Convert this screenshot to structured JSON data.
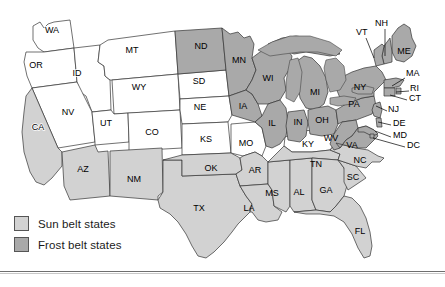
{
  "figure": {
    "colors": {
      "sun_belt": "#d2d2d2",
      "frost_belt": "#a9a9a9",
      "unshaded": "#ffffff",
      "outline": "#333333",
      "label_text": "#000000"
    }
  },
  "legend": {
    "items": [
      {
        "swatch": "sun-belt-swatch",
        "label": "Sun belt states",
        "color": "#d2d2d2"
      },
      {
        "swatch": "frost-belt-swatch",
        "label": "Frost belt states",
        "color": "#a9a9a9"
      }
    ]
  },
  "map": {
    "classification": {
      "sun_belt": [
        "CA",
        "AZ",
        "NM",
        "TX",
        "OK",
        "AR",
        "LA",
        "MS",
        "AL",
        "GA",
        "FL",
        "SC",
        "NC",
        "TN"
      ],
      "frost_belt": [
        "ND",
        "MN",
        "WI",
        "MI",
        "IA",
        "IL",
        "IN",
        "OH",
        "PA",
        "NY",
        "WV",
        "VA",
        "MD",
        "DE",
        "NJ",
        "CT",
        "RI",
        "MA",
        "VT",
        "NH",
        "ME",
        "DC"
      ],
      "unshaded": [
        "WA",
        "OR",
        "ID",
        "MT",
        "WY",
        "NV",
        "UT",
        "CO",
        "SD",
        "NE",
        "KS",
        "MO",
        "KY"
      ]
    },
    "labels_on_state": [
      {
        "abbr": "WA",
        "x": 52,
        "y": 31,
        "shade": "none"
      },
      {
        "abbr": "OR",
        "x": 36,
        "y": 66,
        "shade": "none"
      },
      {
        "abbr": "ID",
        "x": 77,
        "y": 74,
        "shade": "none"
      },
      {
        "abbr": "MT",
        "x": 132,
        "y": 51,
        "shade": "none"
      },
      {
        "abbr": "ND",
        "x": 201,
        "y": 47,
        "shade": "frost"
      },
      {
        "abbr": "MN",
        "x": 239,
        "y": 61,
        "shade": "frost"
      },
      {
        "abbr": "SD",
        "x": 199,
        "y": 82,
        "shade": "none"
      },
      {
        "abbr": "WY",
        "x": 139,
        "y": 88,
        "shade": "none"
      },
      {
        "abbr": "WI",
        "x": 268,
        "y": 79,
        "shade": "frost"
      },
      {
        "abbr": "MI",
        "x": 315,
        "y": 93,
        "shade": "frost"
      },
      {
        "abbr": "NE",
        "x": 200,
        "y": 108,
        "shade": "none"
      },
      {
        "abbr": "IA",
        "x": 243,
        "y": 107,
        "shade": "frost"
      },
      {
        "abbr": "NV",
        "x": 68,
        "y": 113,
        "shade": "none"
      },
      {
        "abbr": "UT",
        "x": 106,
        "y": 124,
        "shade": "none"
      },
      {
        "abbr": "CA",
        "x": 38,
        "y": 128,
        "shade": "none"
      },
      {
        "abbr": "CO",
        "x": 152,
        "y": 133,
        "shade": "none"
      },
      {
        "abbr": "KS",
        "x": 206,
        "y": 140,
        "shade": "none"
      },
      {
        "abbr": "MO",
        "x": 246,
        "y": 144,
        "shade": "none"
      },
      {
        "abbr": "IL",
        "x": 272,
        "y": 124,
        "shade": "frost"
      },
      {
        "abbr": "IN",
        "x": 298,
        "y": 123,
        "shade": "frost"
      },
      {
        "abbr": "OH",
        "x": 322,
        "y": 121,
        "shade": "frost"
      },
      {
        "abbr": "PA",
        "x": 354,
        "y": 105,
        "shade": "frost"
      },
      {
        "abbr": "NY",
        "x": 360,
        "y": 88,
        "shade": "frost"
      },
      {
        "abbr": "WV",
        "x": 331,
        "y": 139,
        "shade": "frost"
      },
      {
        "abbr": "VA",
        "x": 352,
        "y": 146,
        "shade": "frost"
      },
      {
        "abbr": "KY",
        "x": 308,
        "y": 145,
        "shade": "none"
      },
      {
        "abbr": "NC",
        "x": 360,
        "y": 161,
        "shade": "sun"
      },
      {
        "abbr": "TN",
        "x": 316,
        "y": 165,
        "shade": "sun"
      },
      {
        "abbr": "SC",
        "x": 353,
        "y": 178,
        "shade": "sun"
      },
      {
        "abbr": "AZ",
        "x": 83,
        "y": 170,
        "shade": "sun"
      },
      {
        "abbr": "NM",
        "x": 134,
        "y": 180,
        "shade": "sun"
      },
      {
        "abbr": "OK",
        "x": 211,
        "y": 169,
        "shade": "sun"
      },
      {
        "abbr": "AR",
        "x": 255,
        "y": 171,
        "shade": "sun"
      },
      {
        "abbr": "MS",
        "x": 272,
        "y": 194,
        "shade": "sun"
      },
      {
        "abbr": "AL",
        "x": 299,
        "y": 193,
        "shade": "sun"
      },
      {
        "abbr": "GA",
        "x": 326,
        "y": 191,
        "shade": "sun"
      },
      {
        "abbr": "TX",
        "x": 199,
        "y": 209,
        "shade": "sun"
      },
      {
        "abbr": "LA",
        "x": 249,
        "y": 209,
        "shade": "sun"
      },
      {
        "abbr": "FL",
        "x": 360,
        "y": 232,
        "shade": "sun"
      },
      {
        "abbr": "ME",
        "x": 404,
        "y": 52,
        "shade": "frost"
      }
    ],
    "labels_callout": [
      {
        "abbr": "VT",
        "tx": 356,
        "ty": 33,
        "lx1": 366,
        "ly1": 38,
        "lx2": 374,
        "ly2": 58
      },
      {
        "abbr": "NH",
        "tx": 375,
        "ty": 24,
        "lx1": 385,
        "ly1": 29,
        "lx2": 385,
        "ly2": 56
      },
      {
        "abbr": "MA",
        "tx": 406,
        "ty": 74,
        "lx1": 405,
        "ly1": 78,
        "lx2": 392,
        "ly2": 86
      },
      {
        "abbr": "RI",
        "tx": 410,
        "ty": 89,
        "lx1": 409,
        "ly1": 91,
        "lx2": 396,
        "ly2": 92
      },
      {
        "abbr": "CT",
        "tx": 409,
        "ty": 99,
        "lx1": 407,
        "ly1": 100,
        "lx2": 390,
        "ly2": 95
      },
      {
        "abbr": "NJ",
        "tx": 388,
        "ty": 110,
        "lx1": 387,
        "ly1": 111,
        "lx2": 376,
        "ly2": 106
      },
      {
        "abbr": "DE",
        "tx": 393,
        "ty": 124,
        "lx1": 391,
        "ly1": 125,
        "lx2": 378,
        "ly2": 122
      },
      {
        "abbr": "MD",
        "tx": 393,
        "ty": 136,
        "lx1": 391,
        "ly1": 137,
        "lx2": 375,
        "ly2": 131
      },
      {
        "abbr": "DC",
        "tx": 407,
        "ty": 146,
        "lx1": 405,
        "ly1": 147,
        "lx2": 373,
        "ly2": 138
      }
    ]
  }
}
